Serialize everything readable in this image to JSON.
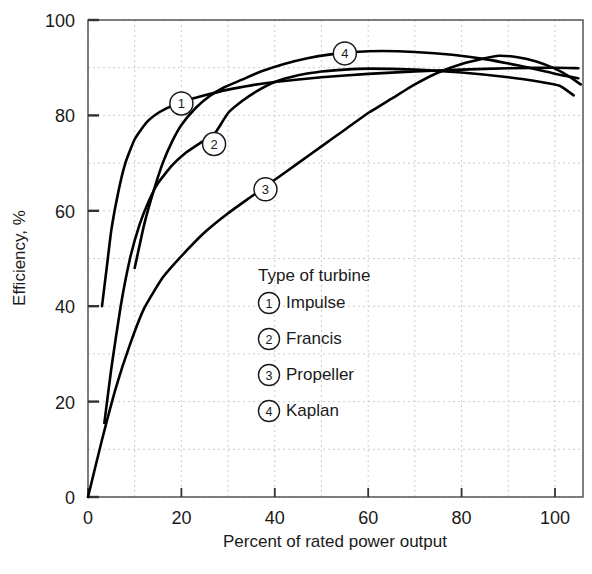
{
  "chart_data": {
    "type": "line",
    "title": "",
    "xlabel": "Percent of rated power output",
    "ylabel": "Efficiency, %",
    "xlim": [
      0,
      106
    ],
    "ylim": [
      0,
      100
    ],
    "xticks": [
      0,
      20,
      40,
      60,
      80,
      100
    ],
    "yticks": [
      0,
      20,
      40,
      60,
      80,
      100
    ],
    "xticklabels": [
      "0",
      "20",
      "40",
      "60",
      "80",
      "100"
    ],
    "yticklabels": [
      "0",
      "20",
      "40",
      "60",
      "80",
      "100"
    ],
    "grid": true,
    "grid_style": "dashed",
    "grid_step_x": 10,
    "grid_step_y": 10,
    "legend_position": "center-right-inside",
    "legend_title": "Type of turbine",
    "series": [
      {
        "id": 1,
        "name": "Impulse",
        "marker_label": "1",
        "marker_point": [
          20,
          82.5
        ],
        "points": [
          [
            3,
            40
          ],
          [
            4,
            48
          ],
          [
            5,
            56
          ],
          [
            6.5,
            64
          ],
          [
            8,
            70
          ],
          [
            10,
            75
          ],
          [
            12.5,
            78.5
          ],
          [
            15,
            80.5
          ],
          [
            17.5,
            81.8
          ],
          [
            20,
            82.8
          ],
          [
            25,
            84.2
          ],
          [
            30,
            85.4
          ],
          [
            35,
            86.3
          ],
          [
            40,
            87.0
          ],
          [
            50,
            88.0
          ],
          [
            60,
            88.7
          ],
          [
            70,
            89.2
          ],
          [
            80,
            89.6
          ],
          [
            90,
            89.9
          ],
          [
            100,
            90.0
          ],
          [
            105,
            89.9
          ]
        ]
      },
      {
        "id": 2,
        "name": "Francis",
        "marker_label": "2",
        "marker_point": [
          27,
          74
        ],
        "points": [
          [
            3.5,
            15.5
          ],
          [
            5,
            27
          ],
          [
            7,
            40
          ],
          [
            9,
            50
          ],
          [
            11,
            57
          ],
          [
            13,
            62
          ],
          [
            15,
            65.8
          ],
          [
            18,
            69.5
          ],
          [
            21,
            72.2
          ],
          [
            24,
            74.2
          ],
          [
            27,
            76.0
          ],
          [
            30,
            80.5
          ],
          [
            33,
            83.0
          ],
          [
            36,
            85.0
          ],
          [
            40,
            87.0
          ],
          [
            45,
            88.4
          ],
          [
            50,
            89.2
          ],
          [
            55,
            89.6
          ],
          [
            60,
            89.8
          ],
          [
            70,
            89.6
          ],
          [
            80,
            89.0
          ],
          [
            90,
            88.0
          ],
          [
            97,
            87.0
          ],
          [
            101,
            86.2
          ],
          [
            104,
            84.2
          ]
        ]
      },
      {
        "id": 3,
        "name": "Propeller",
        "marker_label": "3",
        "marker_point": [
          38,
          64.5
        ],
        "points": [
          [
            0,
            0
          ],
          [
            3,
            12
          ],
          [
            6,
            23
          ],
          [
            9,
            32
          ],
          [
            12,
            39.5
          ],
          [
            16,
            46
          ],
          [
            20,
            50.5
          ],
          [
            25,
            55.5
          ],
          [
            30,
            59.5
          ],
          [
            35,
            63
          ],
          [
            40,
            66.5
          ],
          [
            45,
            70
          ],
          [
            50,
            73.5
          ],
          [
            55,
            77
          ],
          [
            60,
            80.5
          ],
          [
            65,
            83.5
          ],
          [
            70,
            86.5
          ],
          [
            75,
            89
          ],
          [
            80,
            90.8
          ],
          [
            85,
            92
          ],
          [
            88,
            92.5
          ],
          [
            92,
            92.2
          ],
          [
            96,
            91.3
          ],
          [
            100,
            89.8
          ],
          [
            103,
            88.2
          ],
          [
            105.5,
            86.5
          ]
        ]
      },
      {
        "id": 4,
        "name": "Kaplan",
        "marker_label": "4",
        "marker_point": [
          55,
          93
        ],
        "points": [
          [
            10,
            48
          ],
          [
            12,
            57
          ],
          [
            14,
            64
          ],
          [
            16,
            70
          ],
          [
            18,
            74.5
          ],
          [
            20,
            78
          ],
          [
            23,
            81.5
          ],
          [
            26,
            84
          ],
          [
            29,
            85.8
          ],
          [
            33,
            87.5
          ],
          [
            37,
            89.2
          ],
          [
            42,
            90.8
          ],
          [
            47,
            92.0
          ],
          [
            52,
            92.8
          ],
          [
            57,
            93.3
          ],
          [
            63,
            93.5
          ],
          [
            70,
            93.3
          ],
          [
            78,
            92.7
          ],
          [
            85,
            91.8
          ],
          [
            92,
            90.5
          ],
          [
            98,
            89.2
          ],
          [
            102,
            88.3
          ],
          [
            105,
            87.8
          ]
        ]
      }
    ],
    "legend_entries": [
      {
        "marker": "1",
        "label": "Impulse"
      },
      {
        "marker": "2",
        "label": "Francis"
      },
      {
        "marker": "3",
        "label": "Propeller"
      },
      {
        "marker": "4",
        "label": "Kaplan"
      }
    ],
    "colors": {
      "curve": "#000000",
      "axis": "#4a4a4a",
      "grid": "#cccccc",
      "text": "#1a1a1a",
      "background": "#ffffff"
    }
  }
}
